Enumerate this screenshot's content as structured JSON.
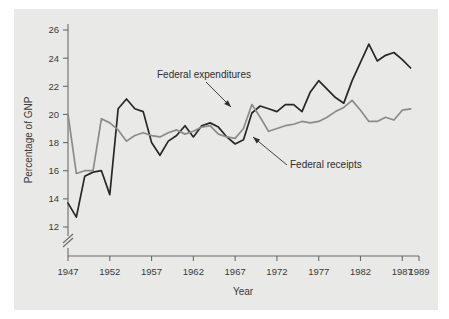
{
  "figure": {
    "background_color": "#e9e9e7",
    "page_color": "#ffffff"
  },
  "chart_data": {
    "type": "line",
    "title": "",
    "subtitle": "",
    "xlabel": "Year",
    "ylabel": "Percentage of GNP",
    "xlim": [
      1947,
      1989
    ],
    "ylim": [
      11.2,
      26.6
    ],
    "grid": false,
    "legend_position": "inline-annotations",
    "axis_break": {
      "axis": "y",
      "below_value": 12,
      "symbol": "double-slash"
    },
    "xticks": [
      1947,
      1952,
      1957,
      1962,
      1967,
      1972,
      1977,
      1982,
      1987,
      1989
    ],
    "xtick_labels": [
      "1947",
      "1952",
      "1957",
      "1962",
      "1967",
      "1972",
      "1977",
      "1982",
      "1987",
      "1989"
    ],
    "yticks": [
      12,
      14,
      16,
      18,
      20,
      22,
      24,
      26
    ],
    "ytick_labels": [
      "12",
      "14",
      "16",
      "18",
      "20",
      "22",
      "24",
      "26"
    ],
    "x": [
      1947,
      1948,
      1949,
      1950,
      1951,
      1952,
      1953,
      1954,
      1955,
      1956,
      1957,
      1958,
      1959,
      1960,
      1961,
      1962,
      1963,
      1964,
      1965,
      1966,
      1967,
      1968,
      1969,
      1970,
      1971,
      1972,
      1973,
      1974,
      1975,
      1976,
      1977,
      1978,
      1979,
      1980,
      1981,
      1982,
      1983,
      1984,
      1985,
      1986,
      1987,
      1988
    ],
    "series": [
      {
        "name": "Federal expenditures",
        "color": "#272727",
        "values": [
          13.7,
          12.7,
          15.6,
          15.9,
          16.0,
          14.3,
          20.4,
          21.1,
          20.4,
          20.2,
          18.0,
          17.1,
          18.1,
          18.5,
          19.2,
          18.4,
          19.2,
          19.4,
          19.1,
          18.4,
          17.9,
          18.2,
          20.1,
          20.6,
          20.4,
          20.2,
          20.7,
          20.7,
          20.2,
          21.6,
          22.4,
          21.8,
          21.2,
          20.8,
          22.4,
          23.7,
          25.0,
          23.8,
          24.2,
          24.4,
          23.9,
          23.3
        ]
      },
      {
        "name": "Federal receipts",
        "color": "#8b8b8b",
        "values": [
          20.0,
          15.8,
          16.0,
          16.0,
          19.7,
          19.4,
          18.9,
          18.1,
          18.5,
          18.7,
          18.5,
          18.4,
          18.7,
          18.9,
          18.6,
          18.8,
          19.1,
          19.2,
          18.6,
          18.4,
          18.3,
          19.0,
          20.7,
          19.8,
          18.8,
          19.0,
          19.2,
          19.3,
          19.5,
          19.4,
          19.5,
          19.8,
          20.2,
          20.5,
          21.0,
          20.3,
          19.5,
          19.5,
          19.8,
          19.6,
          20.3,
          20.4
        ]
      }
    ],
    "annotations": [
      {
        "text": "Federal expenditures",
        "target_series": "Federal expenditures",
        "label_x_px": 157,
        "label_y_px": 78,
        "arrow_from_px": [
          206,
          82
        ],
        "arrow_to_px": [
          231,
          107
        ]
      },
      {
        "text": "Federal receipts",
        "target_series": "Federal receipts",
        "label_x_px": 290,
        "label_y_px": 168,
        "arrow_from_px": [
          287,
          165
        ],
        "arrow_to_px": [
          253,
          137
        ]
      }
    ]
  }
}
